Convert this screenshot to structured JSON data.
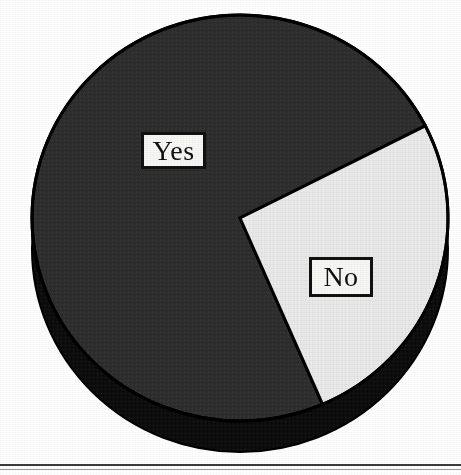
{
  "figure": {
    "background_color": "#ffffff",
    "bottom_rule_color": "#3a3a3a"
  },
  "chart_data": {
    "type": "pie",
    "title": "",
    "subtitle": "",
    "xlabel": "",
    "ylabel": "",
    "legend_position": "none",
    "grid": false,
    "three_d": true,
    "start_angle_deg": 333,
    "direction": "counterclockwise",
    "categories": [
      "Yes",
      "No"
    ],
    "values": [
      74,
      26
    ],
    "value_unit": "percent",
    "labels_shown_in_plot": [
      "Yes",
      "No"
    ],
    "slices": [
      {
        "label": "Yes",
        "value": 74,
        "fill_color": "#2e2e2e",
        "edge_color": "#000000",
        "depth_color": "#0d0d0d",
        "label_box_text": "Yes"
      },
      {
        "label": "No",
        "value": 26,
        "fill_color": "#e9e9e9",
        "edge_color": "#000000",
        "depth_color": "#121212",
        "label_box_text": "No"
      }
    ]
  },
  "labels": {
    "yes": "Yes",
    "no": "No"
  },
  "colors": {
    "slice_dark": "#2e2e2e",
    "slice_light": "#e9e9e9",
    "outline": "#000000",
    "depth_shadow": "#0d0d0d",
    "label_box_fill": "#f7f7f5",
    "label_box_border": "#111111",
    "label_text": "#101010"
  }
}
